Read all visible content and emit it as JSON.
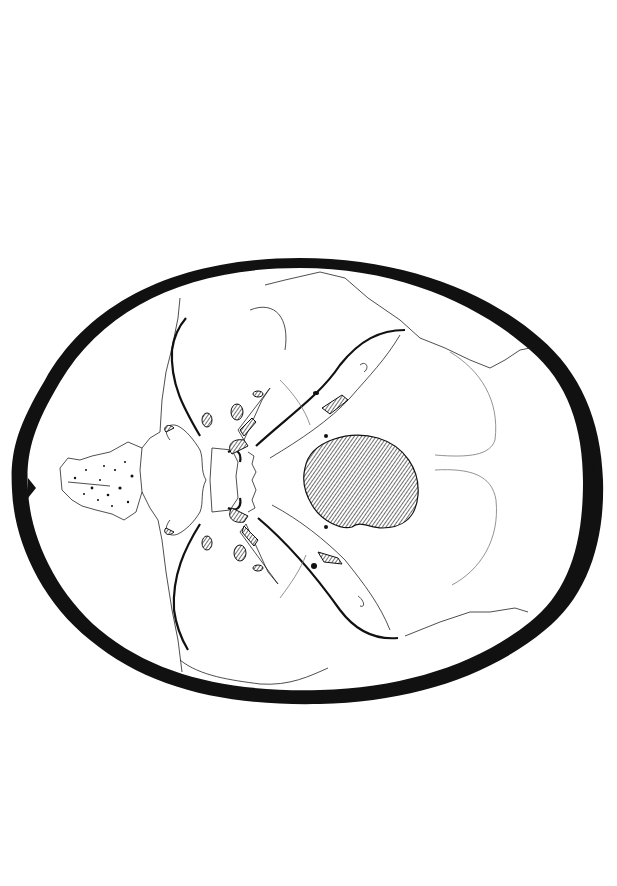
{
  "colors": {
    "ink": "#111111",
    "paper": "#ffffff",
    "hatch": "#333333"
  },
  "labels_top": [
    {
      "id": "crista-galli",
      "text": "crista galli",
      "x": 87,
      "y_end": 285,
      "y_line_to": 470,
      "size": 9
    },
    {
      "id": "cribriform-plate",
      "text": "horizontal or cribriform plate of ethmoid",
      "x": 108,
      "y_end": 290,
      "y_line_to": 462,
      "size": 12
    },
    {
      "id": "body-of-sphenoid-1",
      "text": "body of sphenoid",
      "x": 158,
      "y_end": 290,
      "y_line_to": 465,
      "size": 11
    },
    {
      "id": "lesser-wing-sphenoid",
      "text": "lesser wing of sphenoid",
      "x": 168,
      "y_end": 290,
      "y_line_to": 400,
      "size": 11
    },
    {
      "id": "ridge-anterior-middle",
      "text": "ridge between anterior and middle fossae",
      "x": 176,
      "y_end": 290,
      "y_line_to": 320,
      "size": 8
    },
    {
      "id": "greater-wing-sphenoid",
      "text": "greater wing of sphenoid",
      "x": 191,
      "y_end": 290,
      "y_line_to": 352,
      "size": 11
    },
    {
      "id": "sella-turcica",
      "text": "sella turcica",
      "x": 208,
      "y_end": 290,
      "y_line_to": 473,
      "size": 11
    },
    {
      "id": "body-of-sphenoid-2",
      "text": "body of sphenoid",
      "x": 225,
      "y_end": 290,
      "y_line_to": 477,
      "size": 11
    },
    {
      "id": "squamous-temporal",
      "text": "squamous portion of temporal",
      "x": 250,
      "y_end": 290,
      "y_line_to": 330,
      "size": 11
    },
    {
      "id": "body-of-occipital",
      "text": "body of occipital",
      "x": 280,
      "y_end": 290,
      "y_line_to": 468,
      "size": 11
    },
    {
      "id": "petrous-temporal",
      "text": "petrous portion of temporal",
      "x": 314,
      "y_end": 230,
      "y_line_to": 380,
      "x2": 320,
      "size": 11
    },
    {
      "id": "ridge-middle-posterior",
      "text": "ridge between middle and posterior fossae",
      "x": 345,
      "y_end": 238,
      "y_line_to": 348,
      "size": 8
    },
    {
      "id": "occipital",
      "text": "occipital",
      "x": 428,
      "y_end": 258,
      "y_line_to": 396,
      "size": 11
    },
    {
      "id": "parietal",
      "text": "parietal",
      "x": 465,
      "y_end": 272,
      "y_line_to": 340,
      "size": 11
    }
  ],
  "labels_bottom": [
    {
      "id": "frontal",
      "text": "frontal",
      "x": 95,
      "y_start": 596,
      "y_line_from": 596,
      "size": 11
    },
    {
      "id": "optic-foramen",
      "text": "optic foramen",
      "x": 166,
      "y_start": 693,
      "y_line_from": 533,
      "size": 11
    },
    {
      "id": "foramen-rotundum",
      "text": "foramen rotundum",
      "x": 202,
      "y_start": 708,
      "y_line_from": 543,
      "size": 9
    },
    {
      "id": "foramen-lacerum",
      "text": "foramen lacerum",
      "x": 234,
      "y_start": 723,
      "y_line_from": 512,
      "size": 9
    },
    {
      "id": "foramen-ovale",
      "text": "foramen ovale",
      "x": 242,
      "y_start": 723,
      "y_line_from": 553,
      "size": 9
    },
    {
      "id": "foramen-spinosum",
      "text": "foramen spinosum",
      "x": 259,
      "y_start": 723,
      "y_line_from": 570,
      "size": 9
    },
    {
      "id": "internal-auditory-meatus",
      "text": "internal auditory meatus",
      "x": 316,
      "y_start": 728,
      "y_line_from": 573,
      "size": 9
    },
    {
      "id": "anterior-condylar-canal",
      "text": "anterior condylar canal",
      "x": 327,
      "y_start": 728,
      "y_line_from": 530,
      "size": 9
    },
    {
      "id": "jugular-foramen",
      "text": "jugular foramen",
      "x": 337,
      "y_start": 728,
      "y_line_from": 560,
      "size": 9
    },
    {
      "id": "mastoid-foramen",
      "text": "mastoid foramen",
      "x": 360,
      "y_start": 728,
      "y_line_from": 600,
      "size": 9
    },
    {
      "id": "foramen-magnum",
      "text": "foramen magnum",
      "x": 384,
      "y_start": 728,
      "y_line_from": 512,
      "size": 11
    }
  ]
}
